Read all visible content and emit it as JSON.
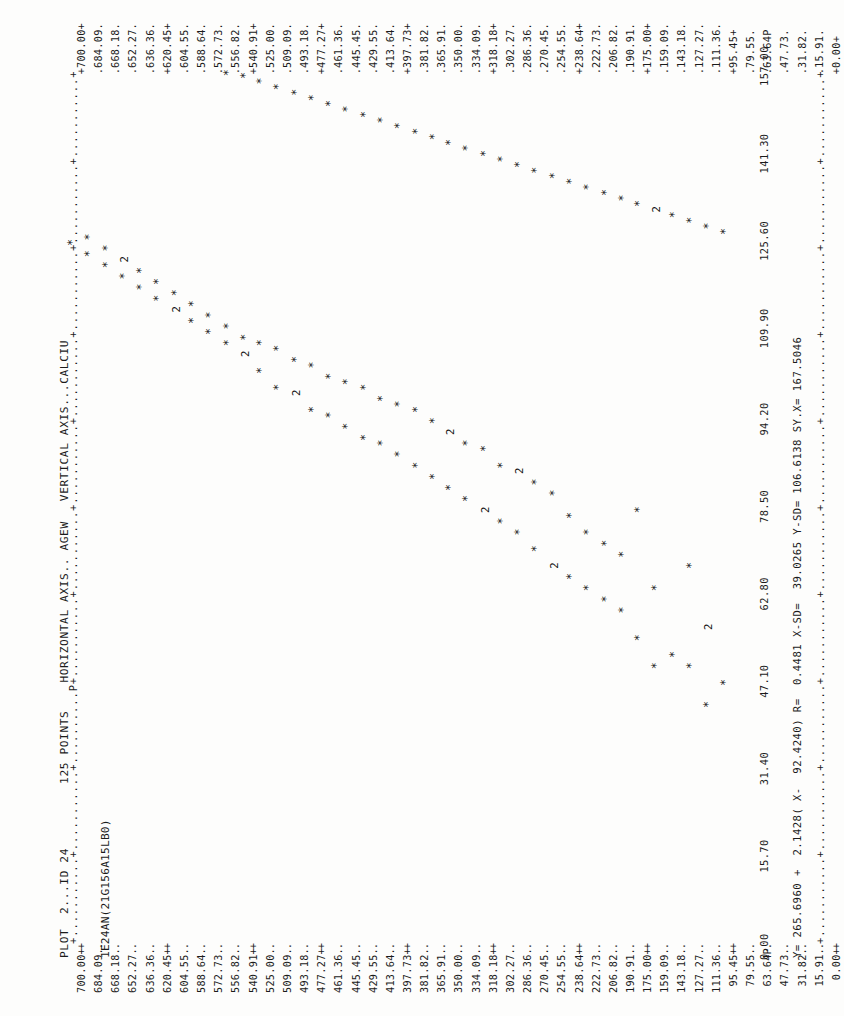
{
  "header": {
    "line1": "PLOT  2...ID 24",
    "line2": "1E24AN(21G156A15LB0)",
    "points_label": "125 POINTS",
    "horizontal_axis_label": "HORIZONTAL AXIS.. AGEW",
    "vertical_axis_label": "VERTICAL AXIS...CALCIU"
  },
  "stats_line": "Y= 265.6960 +  2.1428( X-  92.4240) R=  0.4481 X-SD=  39.0265 Y-SD= 106.6138 SY.X= 167.5046",
  "axis_glyphs": {
    "tick": "+",
    "minor": ".",
    "point_marker": "*",
    "overprint_two": "2",
    "overprint_p": "P"
  },
  "y_tick_labels": [
    "700.00+",
    "684.09.",
    "668.18.",
    "652.27.",
    "636.36.",
    "620.45+",
    "604.55.",
    "588.64.",
    "572.73.",
    "556.82.",
    "540.91+",
    "525.00.",
    "509.09.",
    "493.18.",
    "477.27+",
    "461.36.",
    "445.45.",
    "429.55.",
    "413.64.",
    "397.73+",
    "381.82.",
    "365.91.",
    "350.00.",
    "334.09.",
    "318.18+",
    "302.27.",
    "286.36.",
    "270.45.",
    "254.55.",
    "238.64+",
    "222.73.",
    "206.82.",
    "190.91.",
    "175.00+",
    "159.09.",
    "143.18.",
    "127.27.",
    "111.36.",
    "95.45+",
    "79.55.",
    "63.64P",
    "47.73.",
    "31.82.",
    "15.91.",
    "0.00+"
  ],
  "x_tick_labels": [
    "0.00",
    "15.70",
    "31.40",
    "47.10",
    "62.80",
    "78.50",
    "94.20",
    "109.90",
    "125.60",
    "141.30",
    "157.00"
  ],
  "chart_data": {
    "type": "scatter",
    "title": "PLOT  2...ID 24",
    "xlabel": "HORIZONTAL AXIS.. AGEW",
    "ylabel": "VERTICAL AXIS...CALCIU",
    "n_points": 125,
    "xlim": [
      0.0,
      157.0
    ],
    "ylim": [
      0.0,
      700.0
    ],
    "grid": false,
    "regression": {
      "intercept_at_xbar": 265.696,
      "slope": 2.1428,
      "x_mean": 92.424,
      "r": 0.4481,
      "x_sd": 39.0265,
      "y_sd": 106.6138,
      "sy_x": 167.5046
    },
    "series": [
      {
        "name": "CALCIU vs AGEW",
        "marker": "*",
        "x": [
          43.0,
          47.0,
          50.0,
          50.0,
          52.0,
          55.0,
          57.0,
          60.0,
          62.0,
          64.0,
          64.0,
          66.0,
          68.0,
          68.0,
          70.0,
          71.0,
          72.0,
          74.0,
          74.0,
          76.0,
          77.0,
          78.0,
          78.0,
          80.0,
          81.0,
          82.0,
          83.0,
          84.0,
          85.0,
          86.0,
          86.0,
          88.0,
          89.0,
          90.0,
          90.0,
          91.0,
          92.0,
          93.0,
          94.0,
          95.0,
          96.0,
          96.0,
          97.0,
          98.0,
          99.0,
          100.0,
          100.0,
          101.0,
          102.0,
          103.0,
          104.0,
          105.0,
          106.0,
          107.0,
          108.0,
          108.0,
          109.0,
          110.0,
          111.0,
          112.0,
          113.0,
          114.0,
          115.0,
          116.0,
          117.0,
          118.0,
          119.0,
          120.0,
          121.0,
          122.0,
          123.0,
          124.0,
          125.0,
          126.0,
          127.0,
          128.0,
          129.0,
          130.0,
          131.0,
          132.0,
          133.0,
          134.0,
          135.0,
          136.0,
          137.0,
          138.0,
          139.0,
          140.0,
          141.0,
          142.0,
          143.0,
          144.0,
          145.0,
          146.0,
          147.0,
          148.0,
          149.0,
          150.0,
          151.0,
          152.0,
          153.0,
          154.0,
          155.0,
          156.0,
          156.5
        ],
        "y": [
          111.0,
          95.0,
          127.0,
          159.0,
          143.0,
          175.0,
          111.0,
          190.0,
          206.0,
          159.0,
          222.0,
          238.0,
          127.0,
          254.0,
          190.0,
          270.0,
          206.0,
          286.0,
          222.0,
          302.0,
          238.0,
          318.0,
          175.0,
          334.0,
          254.0,
          350.0,
          270.0,
          365.0,
          286.0,
          381.0,
          302.0,
          397.0,
          318.0,
          413.0,
          334.0,
          429.0,
          350.0,
          445.0,
          365.0,
          461.0,
          381.0,
          477.0,
          397.0,
          413.0,
          493.0,
          429.0,
          509.0,
          445.0,
          461.0,
          525.0,
          477.0,
          493.0,
          540.0,
          509.0,
          525.0,
          556.0,
          540.0,
          572.0,
          556.0,
          588.0,
          572.0,
          604.0,
          588.0,
          620.0,
          604.0,
          636.0,
          620.0,
          652.0,
          636.0,
          668.0,
          652.0,
          684.0,
          668.0,
          700.0,
          684.0,
          95.0,
          111.0,
          127.0,
          143.0,
          159.0,
          175.0,
          190.0,
          206.0,
          222.0,
          238.0,
          254.0,
          270.0,
          286.0,
          302.0,
          318.0,
          334.0,
          350.0,
          365.0,
          381.0,
          397.0,
          413.0,
          429.0,
          445.0,
          461.0,
          477.0,
          493.0,
          509.0,
          525.0,
          540.0,
          556.0
        ]
      }
    ],
    "note": "Line-printer character plot; '2' glyphs mark cells containing two coincident observations, 'P' marks an overprinted predicted/plot character."
  }
}
